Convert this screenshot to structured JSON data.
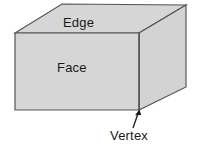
{
  "figure": {
    "labels": {
      "edge": "Edge",
      "face": "Face",
      "vertex": "Vertex"
    },
    "colors": {
      "face_fill": "#d6d6d6",
      "top_fill": "#d6d6d6",
      "side_fill": "#d3d3d3",
      "outline": "#555555",
      "background": "#ffffff",
      "text": "#1a1a1a",
      "arrow": "#1a1a1a"
    },
    "geometry": {
      "front_face": "15,33 139,33 139,110 15,110",
      "top_face": "15,33 62,4 186,5 139,33",
      "right_face": "139,33 186,5 186,87 139,110",
      "arrow_from": "133,128",
      "arrow_to": "139,111"
    }
  }
}
